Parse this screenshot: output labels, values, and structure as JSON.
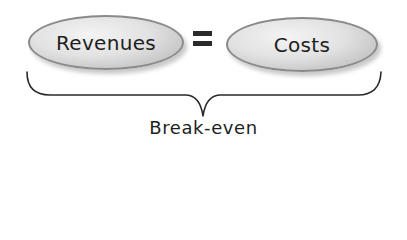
{
  "diagram": {
    "left_term": "Revenues",
    "operator": "=",
    "right_term": "Costs",
    "bracket_label": "Break-even"
  },
  "colors": {
    "ellipse_fill": "#dcdcdc",
    "ellipse_border": "#8a8a8a",
    "text": "#1e1e1e",
    "bracket": "#2a2a2a"
  }
}
